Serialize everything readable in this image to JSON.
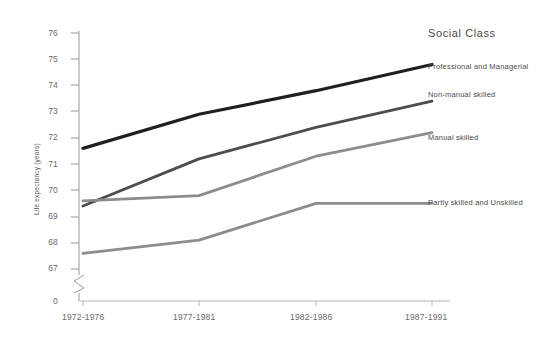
{
  "chart_data": {
    "type": "line",
    "title": "",
    "xlabel": "",
    "ylabel": "Life expectancy (years)",
    "categories": [
      "1972-1976",
      "1977-1981",
      "1982-1986",
      "1987-1991"
    ],
    "ylim": [
      67,
      76
    ],
    "yticks": [
      "0",
      "67",
      "68",
      "69",
      "70",
      "71",
      "72",
      "73",
      "74",
      "75",
      "76"
    ],
    "axis_break": true,
    "grid": false,
    "legend_position": "right",
    "legend_title": "Social Class",
    "series": [
      {
        "name": "Professional and Managerial",
        "color": "#1f1f1f",
        "values": [
          71.6,
          72.9,
          73.8,
          74.8
        ]
      },
      {
        "name": "Non-manual skilled",
        "color": "#4d4d4d",
        "values": [
          69.4,
          71.2,
          72.4,
          73.4
        ]
      },
      {
        "name": "Manual skilled",
        "color": "#8c8c8c",
        "values": [
          69.6,
          69.8,
          71.3,
          72.2
        ]
      },
      {
        "name": "Partly skilled and Unskilled",
        "color": "#8c8c8c",
        "values": [
          67.6,
          68.1,
          69.5,
          69.5
        ]
      }
    ]
  },
  "axis": {
    "tick_0": "0",
    "tick_67": "67",
    "tick_68": "68",
    "tick_69": "69",
    "tick_70": "70",
    "tick_71": "71",
    "tick_72": "72",
    "tick_73": "73",
    "tick_74": "74",
    "tick_75": "75",
    "tick_76": "76"
  },
  "xlabels": {
    "p1": "1972-1976",
    "p2": "1977-1981",
    "p3": "1982-1986",
    "p4": "1987-1991"
  },
  "legend": {
    "title": "Social Class",
    "item1": "Professional and Managerial",
    "item2": "Non-manual skilled",
    "item3": "Manual skilled",
    "item4": "Partly skilled and Unskilled"
  }
}
